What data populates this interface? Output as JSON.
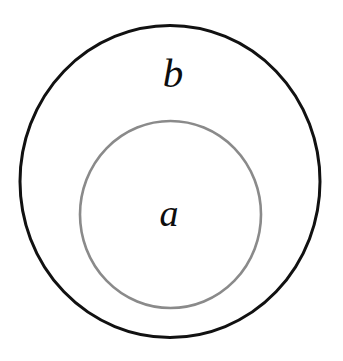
{
  "diagram": {
    "kind": "euler-diagram",
    "background_color": "#ffffff",
    "width": 343,
    "height": 361,
    "sets": [
      {
        "id": "outer",
        "label": "b",
        "role": "containing-set",
        "shape": "circle",
        "stroke_color": "#111111",
        "stroke_width": 3,
        "fill": "none",
        "center_x": 170,
        "center_y": 181.5,
        "radius_x": 150,
        "radius_y": 156,
        "label_x": 173,
        "label_y": 73
      },
      {
        "id": "inner",
        "label": "a",
        "role": "contained-subset",
        "shape": "circle",
        "stroke_color": "#8a8a8a",
        "stroke_width": 2.6,
        "fill": "none",
        "center_x": 170.5,
        "center_y": 214.5,
        "radius_x": 90.5,
        "radius_y": 93.5,
        "label_x": 169,
        "label_y": 213
      }
    ]
  }
}
